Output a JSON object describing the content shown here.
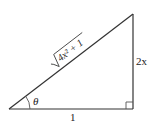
{
  "diagram": {
    "type": "right-triangle",
    "stroke_color": "#333333",
    "vertices": {
      "left": [
        9,
        109
      ],
      "right_angle": [
        133,
        109
      ],
      "top": [
        133,
        14
      ]
    },
    "labels": {
      "hypotenuse_radicand": "4x² + 1",
      "vertical_side": "2x",
      "base": "1",
      "angle": "θ"
    }
  }
}
